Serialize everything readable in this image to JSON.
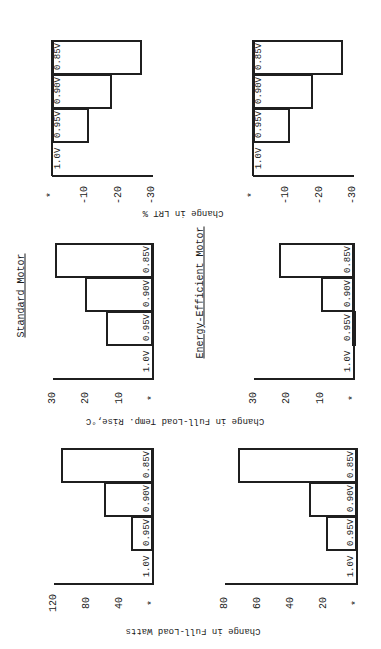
{
  "page": {
    "orientation_note_visible": "",
    "motor_titles": {
      "standard": "Standard Motor",
      "energy_efficient": "Energy-Efficient Motor"
    },
    "axis_titles": {
      "lrt": "Change in LRT %",
      "temp": "Change in Full-Load Temp. Rise,°C",
      "watts": "Change in Full-Load Watts"
    },
    "baseline_marker": "*"
  },
  "chart_data": [
    {
      "id": "lrt-standard",
      "type": "bar",
      "title": "Standard Motor",
      "ylabel": "Change in LRT %",
      "categories": [
        "1.0V",
        "0.95V",
        "0.90V",
        "0.85V"
      ],
      "values": [
        0,
        -11,
        -18,
        -27
      ],
      "ticks": [
        "*",
        "-10",
        "-20",
        "-30"
      ],
      "tick_values": [
        0,
        -10,
        -20,
        -30
      ],
      "ylim": [
        -30,
        0
      ],
      "grid": false
    },
    {
      "id": "lrt-ee",
      "type": "bar",
      "title": "Energy-Efficient Motor",
      "ylabel": "Change in LRT %",
      "categories": [
        "1.0V",
        "0.95V",
        "0.90V",
        "0.85V"
      ],
      "values": [
        0,
        -11,
        -18,
        -27
      ],
      "ticks": [
        "*",
        "-10",
        "-20",
        "-30"
      ],
      "tick_values": [
        0,
        -10,
        -20,
        -30
      ],
      "ylim": [
        -30,
        0
      ],
      "grid": false
    },
    {
      "id": "temp-standard",
      "type": "bar",
      "title": "Standard Motor",
      "ylabel": "Change in Full-Load Temp. Rise,°C",
      "categories": [
        "1.0V",
        "0.95V",
        "0.90V",
        "0.85V"
      ],
      "values": [
        0,
        14,
        20.5,
        29.5
      ],
      "ticks": [
        "*",
        "10",
        "20",
        "30"
      ],
      "tick_values": [
        0,
        10,
        20,
        30
      ],
      "ylim": [
        0,
        30
      ],
      "grid": false
    },
    {
      "id": "temp-ee",
      "type": "bar",
      "title": "Energy-Efficient Motor",
      "ylabel": "Change in Full-Load Temp. Rise,°C",
      "categories": [
        "1.0V",
        "0.95V",
        "0.90V",
        "0.85V"
      ],
      "values": [
        0,
        0.5,
        10,
        22.5
      ],
      "ticks": [
        "*",
        "10",
        "20",
        "30"
      ],
      "tick_values": [
        0,
        10,
        20,
        30
      ],
      "ylim": [
        0,
        30
      ],
      "grid": false
    },
    {
      "id": "watts-standard",
      "type": "bar",
      "title": "Standard Motor",
      "ylabel": "Change in Full-Load Watts",
      "categories": [
        "1.0V",
        "0.95V",
        "0.90V",
        "0.85V"
      ],
      "values": [
        0,
        27,
        59,
        111
      ],
      "ticks": [
        "*",
        "40",
        "80",
        "120"
      ],
      "tick_values": [
        0,
        40,
        80,
        120
      ],
      "ylim": [
        0,
        120
      ],
      "grid": false
    },
    {
      "id": "watts-ee",
      "type": "bar",
      "title": "Energy-Efficient Motor",
      "ylabel": "Change in Full-Load Watts",
      "categories": [
        "1.0V",
        "0.95V",
        "0.90V",
        "0.85V"
      ],
      "values": [
        0,
        19,
        29,
        72
      ],
      "ticks": [
        "*",
        "20",
        "40",
        "60",
        "80"
      ],
      "tick_values": [
        0,
        20,
        40,
        60,
        80
      ],
      "ylim": [
        0,
        80
      ],
      "grid": false
    }
  ]
}
